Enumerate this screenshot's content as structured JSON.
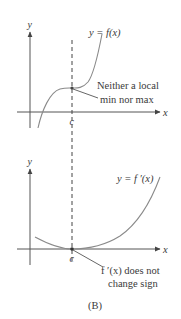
{
  "figure": {
    "caption": "(B)",
    "top_graph": {
      "y_axis_label": "y",
      "x_axis_label": "x",
      "curve_label": "y = f(x)",
      "point_label": "c",
      "annotation_line1": "Neither a local",
      "annotation_line2": "min nor max"
    },
    "bottom_graph": {
      "y_axis_label": "y",
      "x_axis_label": "x",
      "curve_label": "y = f ′(x)",
      "point_label": "c",
      "annotation_line1": "f ′(x) does not",
      "annotation_line2": "change sign"
    }
  },
  "colors": {
    "axis": "#555555",
    "curve": "#8a8a8a",
    "text": "#3a3a3a",
    "background": "#ffffff"
  }
}
